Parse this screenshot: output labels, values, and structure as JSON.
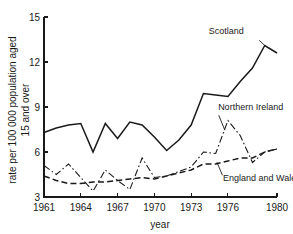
{
  "chart_data": {
    "type": "line",
    "title": "",
    "xlabel": "year",
    "ylabel": "rate per 100 000 population aged 15 and over",
    "ylabel_line1": "rate per 100 000 population aged",
    "ylabel_line2": "15 and over",
    "xlim": [
      1961,
      1980
    ],
    "ylim": [
      3,
      15
    ],
    "yticks": [
      3,
      6,
      9,
      12,
      15
    ],
    "ytick_labels": [
      "3",
      "6",
      "9",
      "12",
      "15"
    ],
    "xticks": [
      1961,
      1964,
      1967,
      1970,
      1973,
      1976,
      1980
    ],
    "xtick_labels": [
      "1961",
      "1964",
      "1967",
      "1970",
      "1973",
      "1976",
      "1980"
    ],
    "grid": false,
    "legend_position": "inline-annotations",
    "x": [
      1961,
      1962,
      1963,
      1964,
      1965,
      1966,
      1967,
      1968,
      1969,
      1970,
      1971,
      1972,
      1973,
      1974,
      1975,
      1976,
      1977,
      1978,
      1979,
      1980
    ],
    "series": [
      {
        "name": "Scotland",
        "style": "solid",
        "label": "Scotland",
        "values": [
          7.3,
          7.6,
          7.8,
          7.9,
          6.0,
          7.9,
          6.9,
          8.0,
          7.8,
          7.0,
          6.1,
          6.8,
          7.8,
          9.9,
          9.8,
          9.7,
          10.7,
          11.6,
          13.1,
          12.6
        ]
      },
      {
        "name": "Northern Ireland",
        "style": "dash-dot",
        "label": "Northern Ireland",
        "values": [
          5.1,
          4.5,
          5.2,
          4.3,
          3.4,
          4.8,
          4.1,
          3.5,
          5.6,
          4.3,
          4.4,
          4.7,
          5.0,
          6.0,
          5.9,
          8.1,
          7.1,
          5.3,
          6.0,
          6.2
        ]
      },
      {
        "name": "England and Wales",
        "style": "dashed",
        "label": "England and Wales",
        "values": [
          4.4,
          4.1,
          3.9,
          3.9,
          4.0,
          4.0,
          4.1,
          4.2,
          4.3,
          4.2,
          4.4,
          4.6,
          4.8,
          5.2,
          5.2,
          5.4,
          5.6,
          5.6,
          6.0,
          6.2
        ]
      }
    ],
    "annotations": [
      {
        "text": "Scotland",
        "x": 1977.3,
        "y": 13.9
      },
      {
        "text": "Northern Ireland",
        "x": 1975.2,
        "y": 8.8
      },
      {
        "text": "England and Wales",
        "x": 1975.6,
        "y": 4.1
      }
    ]
  }
}
